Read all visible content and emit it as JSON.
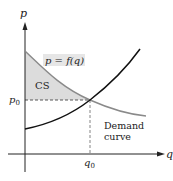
{
  "diagram": {
    "axes": {
      "x_label": "q",
      "y_label": "p"
    },
    "equilibrium": {
      "price_label": "p",
      "price_sub": "0",
      "quantity_label": "q",
      "quantity_sub": "0"
    },
    "curves": {
      "demand_equation": "p = f(q)",
      "demand_label_line1": "Demand",
      "demand_label_line2": "curve"
    },
    "region": {
      "label": "CS"
    },
    "colors": {
      "demand_curve": "#8a8a8a",
      "supply_curve": "#111111",
      "cs_fill": "#dcdcdc",
      "axes": "#222222",
      "equation_bg": "#e6e6e6"
    }
  }
}
